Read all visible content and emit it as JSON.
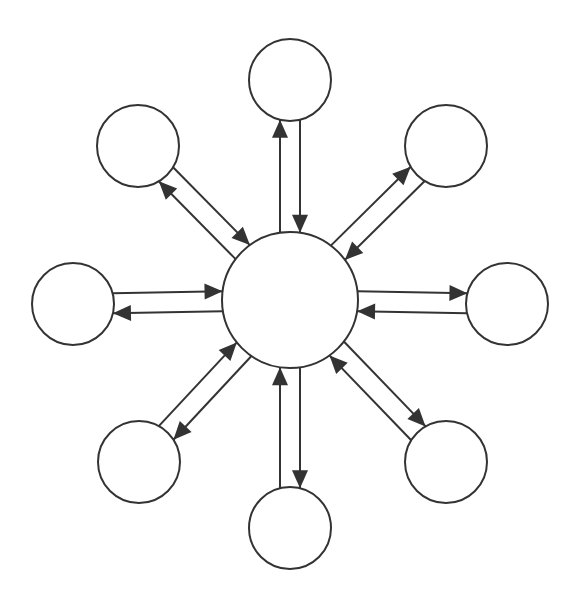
{
  "diagram": {
    "type": "hub-and-spoke bidirectional network",
    "colors": {
      "stroke": "#333333",
      "fill": "#ffffff",
      "arrowhead": "#333333",
      "background": "#ffffff"
    },
    "hub": {
      "id": "hub",
      "cx": 290,
      "cy": 300,
      "r": 68,
      "label": ""
    },
    "spoke_radius": 41,
    "lane_offset": 10,
    "arrowhead": {
      "length": 18,
      "width": 16
    },
    "spokes": [
      {
        "id": "n",
        "cx": 290,
        "cy": 80,
        "label": "",
        "lanes": [
          {
            "offset": -1,
            "dir": "out"
          },
          {
            "offset": 1,
            "dir": "in"
          }
        ]
      },
      {
        "id": "ne",
        "cx": 446,
        "cy": 146,
        "label": "",
        "lanes": [
          {
            "offset": -1,
            "dir": "out"
          },
          {
            "offset": 1,
            "dir": "in"
          }
        ]
      },
      {
        "id": "e",
        "cx": 507,
        "cy": 304,
        "label": "",
        "lanes": [
          {
            "offset": -1,
            "dir": "out"
          },
          {
            "offset": 1,
            "dir": "in"
          }
        ]
      },
      {
        "id": "se",
        "cx": 446,
        "cy": 462,
        "label": "",
        "lanes": [
          {
            "offset": -1,
            "dir": "out"
          },
          {
            "offset": 1,
            "dir": "in"
          }
        ]
      },
      {
        "id": "s",
        "cx": 290,
        "cy": 528,
        "label": "",
        "lanes": [
          {
            "offset": -1,
            "dir": "out"
          },
          {
            "offset": 1,
            "dir": "in"
          }
        ]
      },
      {
        "id": "sw",
        "cx": 139,
        "cy": 462,
        "label": "",
        "lanes": [
          {
            "offset": -1,
            "dir": "out"
          },
          {
            "offset": 1,
            "dir": "in"
          }
        ]
      },
      {
        "id": "w",
        "cx": 73,
        "cy": 304,
        "label": "",
        "lanes": [
          {
            "offset": -1,
            "dir": "out"
          },
          {
            "offset": 1,
            "dir": "in"
          }
        ]
      },
      {
        "id": "nw",
        "cx": 138,
        "cy": 146,
        "label": "",
        "lanes": [
          {
            "offset": -1,
            "dir": "out"
          },
          {
            "offset": 1,
            "dir": "in"
          }
        ]
      }
    ]
  }
}
